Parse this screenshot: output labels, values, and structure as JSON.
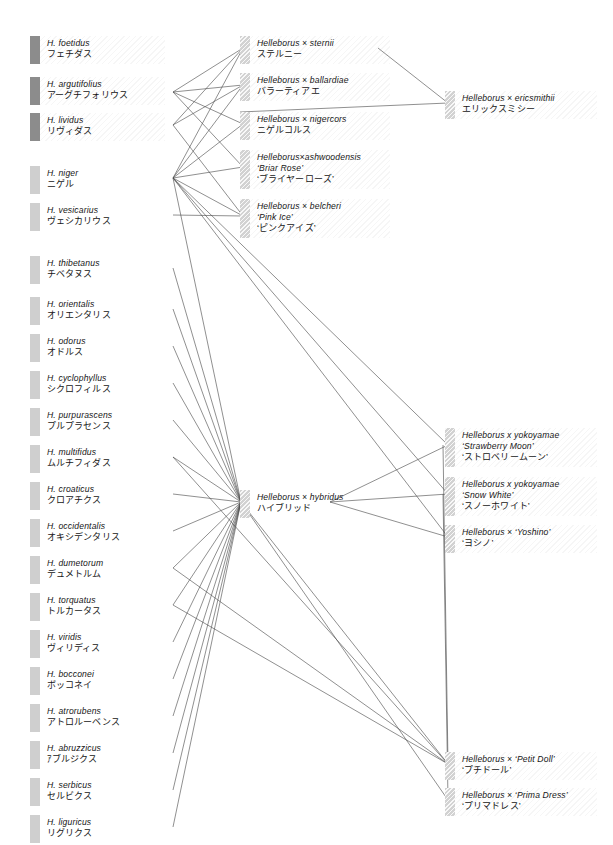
{
  "meta": {
    "diagram_title": "Helleborus species and hybrid parentage diagram",
    "line_color": "#4a4a4a",
    "swatch_dark": "#8c8c8c",
    "swatch_light": "#cfcfcf",
    "swatch_hatch": "#d2d2d2",
    "background": "#ffffff"
  },
  "species": [
    {
      "id": "foetidus",
      "latin": "H. foetidus",
      "kana": "フェチダス",
      "swatch": "dark",
      "band": true,
      "x": 30,
      "y": 36,
      "cx": 173,
      "cy": 48
    },
    {
      "id": "argutifolius",
      "latin": "H. argutifolius",
      "kana": "アーグチフォリウス",
      "swatch": "dark",
      "band": true,
      "x": 30,
      "y": 77,
      "cx": 173,
      "cy": 92
    },
    {
      "id": "lividus",
      "latin": "H. lividus",
      "kana": "リヴィダス",
      "swatch": "dark",
      "band": true,
      "x": 30,
      "y": 113,
      "cx": 173,
      "cy": 125
    },
    {
      "id": "niger",
      "latin": "H. niger",
      "kana": "ニゲル",
      "swatch": "light",
      "band": false,
      "x": 30,
      "y": 166,
      "cx": 173,
      "cy": 178
    },
    {
      "id": "vesicarius",
      "latin": "H. vesicarius",
      "kana": "ヴェシカリウス",
      "swatch": "light",
      "band": false,
      "x": 30,
      "y": 203,
      "cx": 173,
      "cy": 215
    },
    {
      "id": "thibetanus",
      "latin": "H. thibetanus",
      "kana": "チベタヌス",
      "swatch": "light",
      "band": false,
      "x": 30,
      "y": 256,
      "cx": 173,
      "cy": 268
    },
    {
      "id": "orientalis",
      "latin": "H. orientalis",
      "kana": "オリエンタリス",
      "swatch": "light",
      "band": false,
      "x": 30,
      "y": 297,
      "cx": 173,
      "cy": 309
    },
    {
      "id": "odorus",
      "latin": "H. odorus",
      "kana": "オドルス",
      "swatch": "light",
      "band": false,
      "x": 30,
      "y": 334,
      "cx": 173,
      "cy": 346
    },
    {
      "id": "cyclophyllus",
      "latin": "H. cyclophyllus",
      "kana": "シクロフィルス",
      "swatch": "light",
      "band": false,
      "x": 30,
      "y": 371,
      "cx": 173,
      "cy": 383
    },
    {
      "id": "purpurascens",
      "latin": "H. purpurascens",
      "kana": "プルプラセンス",
      "swatch": "light",
      "band": false,
      "x": 30,
      "y": 408,
      "cx": 173,
      "cy": 420
    },
    {
      "id": "multifidus",
      "latin": "H. multifidus",
      "kana": "ムルチフィダス",
      "swatch": "light",
      "band": false,
      "x": 30,
      "y": 445,
      "cx": 173,
      "cy": 457
    },
    {
      "id": "croaticus",
      "latin": "H. croaticus",
      "kana": "クロアチクス",
      "swatch": "light",
      "band": false,
      "x": 30,
      "y": 482,
      "cx": 173,
      "cy": 494
    },
    {
      "id": "occidentalis",
      "latin": "H. occidentalis",
      "kana": "オキシデンタリス",
      "swatch": "light",
      "band": false,
      "x": 30,
      "y": 519,
      "cx": 173,
      "cy": 531
    },
    {
      "id": "dumetorum",
      "latin": "H. dumetorum",
      "kana": "デュメトルム",
      "swatch": "light",
      "band": false,
      "x": 30,
      "y": 556,
      "cx": 173,
      "cy": 568
    },
    {
      "id": "torquatus",
      "latin": "H. torquatus",
      "kana": "トルカータス",
      "swatch": "light",
      "band": false,
      "x": 30,
      "y": 593,
      "cx": 173,
      "cy": 605
    },
    {
      "id": "viridis",
      "latin": "H. viridis",
      "kana": "ヴィリディス",
      "swatch": "light",
      "band": false,
      "x": 30,
      "y": 630,
      "cx": 173,
      "cy": 642
    },
    {
      "id": "bocconei",
      "latin": "H. bocconei",
      "kana": "ボッコネイ",
      "swatch": "light",
      "band": false,
      "x": 30,
      "y": 667,
      "cx": 173,
      "cy": 679
    },
    {
      "id": "atrorubens",
      "latin": "H. atrorubens",
      "kana": "アトロルーベンス",
      "swatch": "light",
      "band": false,
      "x": 30,
      "y": 704,
      "cx": 173,
      "cy": 716
    },
    {
      "id": "abruzzicus",
      "latin": "H. abruzzicus",
      "kana": "ｱブルジクス",
      "swatch": "light",
      "band": false,
      "x": 30,
      "y": 741,
      "cx": 173,
      "cy": 753
    },
    {
      "id": "serbicus",
      "latin": "H. serbicus",
      "kana": "セルビクス",
      "swatch": "light",
      "band": false,
      "x": 30,
      "y": 778,
      "cx": 173,
      "cy": 790
    },
    {
      "id": "liguricus",
      "latin": "H. liguricus",
      "kana": "リグリクス",
      "swatch": "light",
      "band": false,
      "x": 30,
      "y": 815,
      "cx": 173,
      "cy": 827
    }
  ],
  "hybrids_mid": [
    {
      "id": "sternii",
      "latin": "Helleborus × sternii",
      "cultivar": "",
      "kana": "ステルニー",
      "x": 240,
      "y": 36,
      "cx": 243,
      "cy": 48,
      "rx": 378,
      "ry": 48
    },
    {
      "id": "ballardiae",
      "latin": "Helleborus × ballardiae",
      "cultivar": "",
      "kana": "バラーティアエ",
      "x": 240,
      "y": 73,
      "cx": 243,
      "cy": 85,
      "rx": 378,
      "ry": 85
    },
    {
      "id": "nigercors",
      "latin": "Helleborus × nigercors",
      "cultivar": "",
      "kana": "ニゲルコルス",
      "x": 240,
      "y": 112,
      "cx": 243,
      "cy": 124,
      "rx": 378,
      "ry": 124
    },
    {
      "id": "ashwoodensis",
      "latin": "Helleborus×ashwoodensis",
      "cultivar": "‘Briar Rose’",
      "kana": "‘ブライヤーローズ’",
      "x": 240,
      "y": 150,
      "cx": 243,
      "cy": 167,
      "rx": 378,
      "ry": 167
    },
    {
      "id": "belcheri",
      "latin": "Helleborus × belcheri",
      "cultivar": "‘Pink Ice’",
      "kana": "‘ピンクアイズ’",
      "x": 240,
      "y": 199,
      "cx": 243,
      "cy": 216,
      "rx": 378,
      "ry": 216
    }
  ],
  "hybridus": {
    "id": "hybridus",
    "latin": "Helleborus × hybridus",
    "kana": "ハイブリッド",
    "x": 240,
    "y": 490,
    "cx": 241,
    "cy": 502,
    "rx": 330,
    "ry": 502
  },
  "hybrids_right": [
    {
      "id": "ericsmithii",
      "latin": "Helleborus × ericsmithii",
      "cultivar": "",
      "kana": "エリックスミシー",
      "x": 445,
      "y": 91,
      "cx": 448,
      "cy": 103
    },
    {
      "id": "strawberry",
      "latin": "Helleborus x yokoyamae",
      "cultivar": "‘Strawberry Moon’",
      "kana": "‘ストロベリームーン’",
      "x": 445,
      "y": 428,
      "cx": 448,
      "cy": 445
    },
    {
      "id": "snowwhite",
      "latin": "Helleborus x yokoyamae",
      "cultivar": "‘Snow White’",
      "kana": "‘スノーホワイト’",
      "x": 445,
      "y": 477,
      "cx": 448,
      "cy": 494
    },
    {
      "id": "yoshino",
      "latin": "Helleborus × ‘Yoshino’",
      "cultivar": "",
      "kana": "‘ヨシノ’",
      "x": 445,
      "y": 525,
      "cx": 448,
      "cy": 537
    },
    {
      "id": "petitdoll",
      "latin": "Helleborus × ‘Petit Doll’",
      "cultivar": "",
      "kana": "‘プチドール’",
      "x": 445,
      "y": 752,
      "cx": 448,
      "cy": 764
    },
    {
      "id": "primadress",
      "latin": "Helleborus × ‘Prima Dress’",
      "cultivar": "",
      "kana": "‘プリマドレス’",
      "x": 445,
      "y": 788,
      "cx": 448,
      "cy": 800
    }
  ],
  "edges": [
    {
      "from": "argutifolius",
      "to": "sternii",
      "x1": 173,
      "y1": 92,
      "x2": 243,
      "y2": 48
    },
    {
      "from": "lividus",
      "to": "sternii",
      "x1": 173,
      "y1": 125,
      "x2": 243,
      "y2": 48
    },
    {
      "from": "niger",
      "to": "sternii",
      "x1": 173,
      "y1": 178,
      "x2": 243,
      "y2": 48
    },
    {
      "from": "argutifolius",
      "to": "ballardiae",
      "x1": 173,
      "y1": 92,
      "x2": 243,
      "y2": 85
    },
    {
      "from": "lividus",
      "to": "ballardiae",
      "x1": 173,
      "y1": 125,
      "x2": 243,
      "y2": 85
    },
    {
      "from": "niger",
      "to": "ballardiae",
      "x1": 173,
      "y1": 178,
      "x2": 243,
      "y2": 85
    },
    {
      "from": "argutifolius",
      "to": "nigercors",
      "x1": 173,
      "y1": 92,
      "x2": 243,
      "y2": 124
    },
    {
      "from": "niger",
      "to": "nigercors",
      "x1": 173,
      "y1": 178,
      "x2": 243,
      "y2": 124
    },
    {
      "from": "niger",
      "to": "ashwoodensis",
      "x1": 173,
      "y1": 178,
      "x2": 243,
      "y2": 167
    },
    {
      "from": "argutifolius",
      "to": "ashwoodensis",
      "x1": 173,
      "y1": 92,
      "x2": 243,
      "y2": 167
    },
    {
      "from": "niger",
      "to": "belcheri",
      "x1": 173,
      "y1": 178,
      "x2": 243,
      "y2": 216
    },
    {
      "from": "lividus",
      "to": "belcheri",
      "x1": 173,
      "y1": 125,
      "x2": 243,
      "y2": 216
    },
    {
      "from": "vesicarius",
      "to": "belcheri",
      "x1": 173,
      "y1": 215,
      "x2": 243,
      "y2": 216
    },
    {
      "from": "sternii",
      "to": "ericsmithii",
      "x1": 378,
      "y1": 48,
      "x2": 448,
      "y2": 103
    },
    {
      "from": "nigercors",
      "to": "ericsmithii",
      "x1": 240,
      "y1": 112,
      "x2": 448,
      "y2": 103
    },
    {
      "from": "niger",
      "to": "hybridus",
      "x1": 173,
      "y1": 178,
      "x2": 241,
      "y2": 502
    },
    {
      "from": "thibetanus",
      "to": "hybridus",
      "x1": 173,
      "y1": 268,
      "x2": 241,
      "y2": 502
    },
    {
      "from": "orientalis",
      "to": "hybridus",
      "x1": 173,
      "y1": 309,
      "x2": 241,
      "y2": 502
    },
    {
      "from": "odorus",
      "to": "hybridus",
      "x1": 173,
      "y1": 346,
      "x2": 241,
      "y2": 502
    },
    {
      "from": "cyclophyllus",
      "to": "hybridus",
      "x1": 173,
      "y1": 383,
      "x2": 241,
      "y2": 502
    },
    {
      "from": "purpurascens",
      "to": "hybridus",
      "x1": 173,
      "y1": 420,
      "x2": 241,
      "y2": 502
    },
    {
      "from": "multifidus",
      "to": "hybridus",
      "x1": 173,
      "y1": 457,
      "x2": 241,
      "y2": 502
    },
    {
      "from": "croaticus",
      "to": "hybridus",
      "x1": 173,
      "y1": 494,
      "x2": 241,
      "y2": 502
    },
    {
      "from": "occidentalis",
      "to": "hybridus",
      "x1": 173,
      "y1": 531,
      "x2": 241,
      "y2": 502
    },
    {
      "from": "dumetorum",
      "to": "hybridus",
      "x1": 173,
      "y1": 568,
      "x2": 241,
      "y2": 502
    },
    {
      "from": "torquatus",
      "to": "hybridus",
      "x1": 173,
      "y1": 605,
      "x2": 241,
      "y2": 502
    },
    {
      "from": "viridis",
      "to": "hybridus",
      "x1": 173,
      "y1": 642,
      "x2": 241,
      "y2": 502
    },
    {
      "from": "bocconei",
      "to": "hybridus",
      "x1": 173,
      "y1": 679,
      "x2": 241,
      "y2": 502
    },
    {
      "from": "atrorubens",
      "to": "hybridus",
      "x1": 173,
      "y1": 716,
      "x2": 241,
      "y2": 502
    },
    {
      "from": "abruzzicus",
      "to": "hybridus",
      "x1": 173,
      "y1": 753,
      "x2": 241,
      "y2": 502
    },
    {
      "from": "serbicus",
      "to": "hybridus",
      "x1": 173,
      "y1": 790,
      "x2": 241,
      "y2": 502
    },
    {
      "from": "liguricus",
      "to": "hybridus",
      "x1": 173,
      "y1": 827,
      "x2": 241,
      "y2": 502
    },
    {
      "from": "niger",
      "to": "strawberry",
      "x1": 173,
      "y1": 178,
      "x2": 448,
      "y2": 445
    },
    {
      "from": "hybridus",
      "to": "strawberry",
      "x1": 330,
      "y1": 502,
      "x2": 448,
      "y2": 445
    },
    {
      "from": "niger",
      "to": "snowwhite",
      "x1": 173,
      "y1": 178,
      "x2": 448,
      "y2": 494
    },
    {
      "from": "hybridus",
      "to": "snowwhite",
      "x1": 330,
      "y1": 502,
      "x2": 448,
      "y2": 494
    },
    {
      "from": "niger",
      "to": "yoshino",
      "x1": 173,
      "y1": 178,
      "x2": 448,
      "y2": 537
    },
    {
      "from": "hybridus",
      "to": "yoshino",
      "x1": 330,
      "y1": 502,
      "x2": 448,
      "y2": 537
    },
    {
      "from": "hybridus",
      "to": "petitdoll",
      "x1": 241,
      "y1": 502,
      "x2": 448,
      "y2": 764
    },
    {
      "from": "multifidus",
      "to": "petitdoll",
      "x1": 173,
      "y1": 457,
      "x2": 448,
      "y2": 764
    },
    {
      "from": "dumetorum",
      "to": "petitdoll",
      "x1": 173,
      "y1": 568,
      "x2": 448,
      "y2": 764
    },
    {
      "from": "torquatus",
      "to": "petitdoll",
      "x1": 173,
      "y1": 605,
      "x2": 448,
      "y2": 764
    },
    {
      "from": "strawberry",
      "to": "petitdoll",
      "x1": 443,
      "y1": 445,
      "x2": 448,
      "y2": 764
    },
    {
      "from": "hybridus",
      "to": "primadress",
      "x1": 241,
      "y1": 502,
      "x2": 448,
      "y2": 800
    },
    {
      "from": "snowwhite",
      "to": "primadress",
      "x1": 443,
      "y1": 494,
      "x2": 448,
      "y2": 800
    }
  ]
}
